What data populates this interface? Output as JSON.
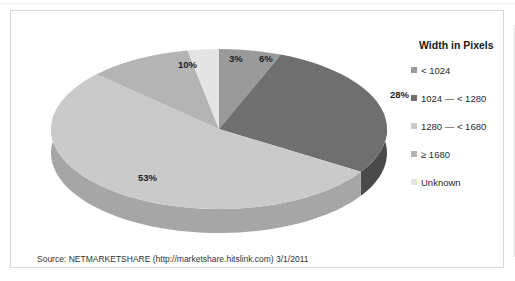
{
  "chart_data": {
    "type": "pie",
    "title": "",
    "legend_title": "Width in Pixels",
    "legend_position": "right",
    "three_d": true,
    "categories": [
      "< 1024",
      "1024 — < 1280",
      "1280 — < 1680",
      "≥ 1680",
      "Unknown"
    ],
    "values": [
      6,
      28,
      53,
      10,
      3
    ],
    "labels": [
      "6%",
      "28%",
      "53%",
      "10%",
      "3%"
    ],
    "units": "percent",
    "colors": [
      "#9a9a9a",
      "#6f6f6f",
      "#cacaca",
      "#b4b4b4",
      "#e4e4e4"
    ],
    "side_colors": [
      "#7b7b7b",
      "#4a4a4a",
      "#a6a6a6",
      "#919191",
      "#c6c6c6"
    ],
    "source": "Source: NETMARKETSHARE (http://marketshare.hitslink.com)   3/1/2011"
  },
  "legend": {
    "title": "Width in Pixels",
    "items": [
      {
        "label": "< 1024",
        "color": "#9a9a9a"
      },
      {
        "label": "1024 — < 1280",
        "color": "#6f6f6f"
      },
      {
        "label": "1280 — < 1680",
        "color": "#cacaca"
      },
      {
        "label": "≥ 1680",
        "color": "#b4b4b4"
      },
      {
        "label": "Unknown",
        "color": "#e4e4e4"
      }
    ]
  },
  "footer": {
    "source_text": "Source: NETMARKETSHARE (http://marketshare.hitslink.com)   3/1/2011"
  }
}
